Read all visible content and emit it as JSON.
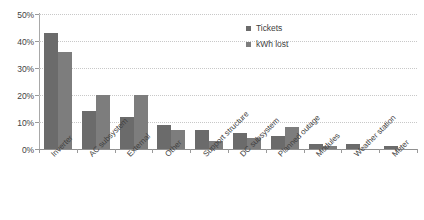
{
  "chart_data": {
    "type": "bar",
    "title": "",
    "xlabel": "",
    "ylabel": "",
    "ylim": [
      0,
      50
    ],
    "ytick_labels": [
      "0%",
      "10%",
      "20%",
      "30%",
      "40%",
      "50%"
    ],
    "ytick_values": [
      0,
      10,
      20,
      30,
      40,
      50
    ],
    "grid": true,
    "legend_position": "top-right",
    "categories": [
      "Inverter",
      "AC subsystem",
      "External",
      "Other",
      "Support structure",
      "DC subsystem",
      "Planned outage",
      "Modules",
      "Weather station",
      "Meter"
    ],
    "series": [
      {
        "name": "Tickets",
        "color": "#6b6b6b",
        "values": [
          43,
          14,
          12,
          9,
          7,
          6,
          5,
          2,
          2,
          1
        ]
      },
      {
        "name": "kWh lost",
        "color": "#7d7d7d",
        "values": [
          36,
          20,
          20,
          7,
          3,
          4,
          8,
          1,
          0,
          0
        ]
      }
    ]
  },
  "legend": {
    "items": [
      {
        "label": "Tickets"
      },
      {
        "label": "kWh lost"
      }
    ]
  }
}
